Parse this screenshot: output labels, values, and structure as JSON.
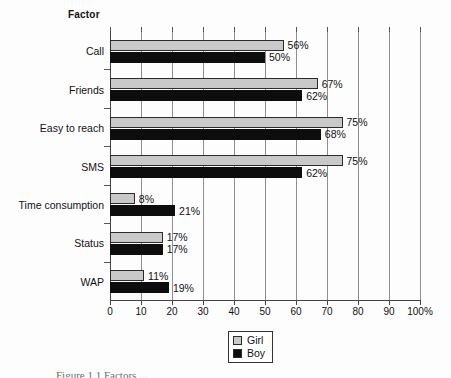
{
  "figure": {
    "axis_title": "Factor",
    "caption": "Figure 1.1 Factors ..."
  },
  "legend": {
    "position": "bottom-center",
    "items": [
      {
        "label": "Girl",
        "color": "#c9c9c9"
      },
      {
        "label": "Boy",
        "color": "#0d0d0d"
      }
    ]
  },
  "chart_data": {
    "type": "bar",
    "orientation": "horizontal",
    "title": "",
    "subtitle": "",
    "xlabel": "",
    "ylabel": "Factor",
    "xlim": [
      0,
      100
    ],
    "xticks": [
      0,
      10,
      20,
      30,
      40,
      50,
      60,
      70,
      80,
      90,
      100
    ],
    "xtick_labels": [
      "0",
      "10",
      "20",
      "30",
      "40",
      "50",
      "60",
      "70",
      "80",
      "90",
      "100%"
    ],
    "grid": "vertical",
    "units": "percent",
    "value_label_suffix": "%",
    "categories": [
      "Call",
      "Friends",
      "Easy to reach",
      "SMS",
      "Time consumption",
      "Status",
      "WAP"
    ],
    "series": [
      {
        "name": "Girl",
        "color": "#c9c9c9",
        "values": [
          56,
          67,
          75,
          75,
          8,
          17,
          11
        ],
        "value_labels": [
          "56%",
          "67%",
          "75%",
          "75%",
          "8%",
          "17%",
          "11%"
        ]
      },
      {
        "name": "Boy",
        "color": "#0d0d0d",
        "values": [
          50,
          62,
          68,
          62,
          21,
          17,
          19
        ],
        "value_labels": [
          "50%",
          "62%",
          "68%",
          "62%",
          "21%",
          "17%",
          "19%"
        ]
      }
    ]
  }
}
